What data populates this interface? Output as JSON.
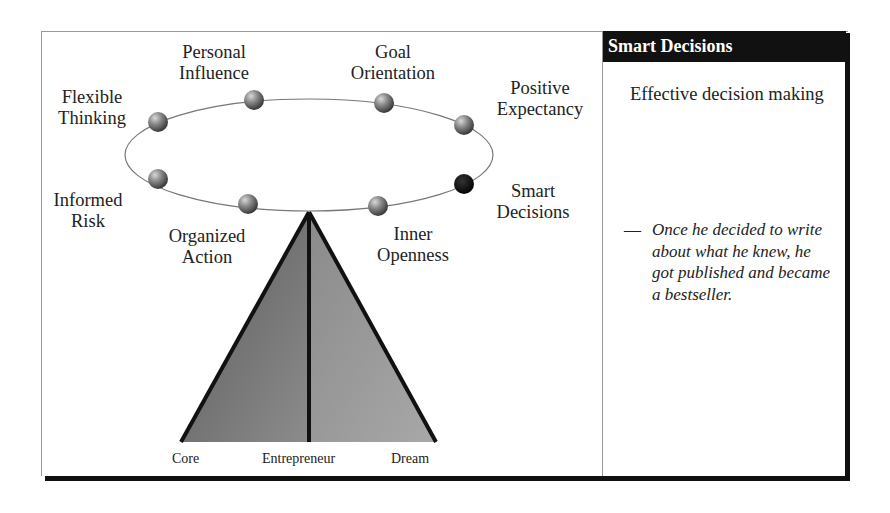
{
  "diagram": {
    "ring_nodes": [
      {
        "id": "personal-influence",
        "label_line1": "Personal",
        "label_line2": "Influence",
        "highlighted": false
      },
      {
        "id": "goal-orientation",
        "label_line1": "Goal",
        "label_line2": "Orientation",
        "highlighted": false
      },
      {
        "id": "flexible-thinking",
        "label_line1": "Flexible",
        "label_line2": "Thinking",
        "highlighted": false
      },
      {
        "id": "positive-expectancy",
        "label_line1": "Positive",
        "label_line2": "Expectancy",
        "highlighted": false
      },
      {
        "id": "informed-risk",
        "label_line1": "Informed",
        "label_line2": "Risk",
        "highlighted": false
      },
      {
        "id": "smart-decisions",
        "label_line1": "Smart",
        "label_line2": "Decisions",
        "highlighted": true
      },
      {
        "id": "organized-action",
        "label_line1": "Organized",
        "label_line2": "Action",
        "highlighted": false
      },
      {
        "id": "inner-openness",
        "label_line1": "Inner",
        "label_line2": "Openness",
        "highlighted": false
      }
    ],
    "pyramid_labels": {
      "left": "Core",
      "center": "Entrepreneur",
      "right": "Dream"
    },
    "colors": {
      "highlight_node": "#111111",
      "normal_node": "#7a7a7a",
      "pyramid_left": "#6e6e6e",
      "pyramid_right": "#9a9a9a",
      "outline": "#111111"
    }
  },
  "side_panel": {
    "title": "Smart Decisions",
    "subtitle": "Effective decision making",
    "quote_dash": "—",
    "quote": "Once he decided to write about what he knew, he got published and became a bestseller."
  }
}
